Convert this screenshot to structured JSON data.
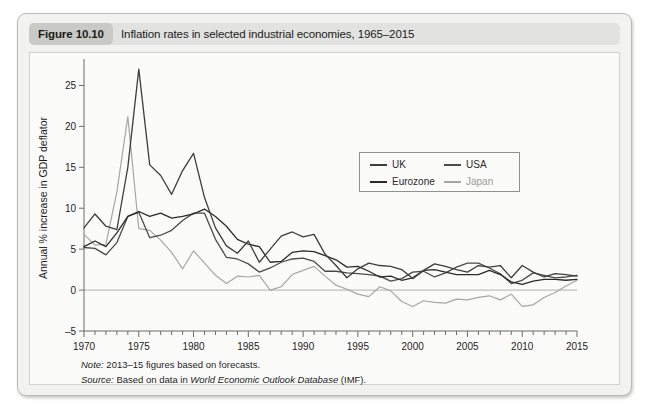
{
  "figure": {
    "badge": "Figure 10.10",
    "caption": "Inflation rates in selected industrial economies, 1965–2015"
  },
  "footnotes": {
    "note_label": "Note:",
    "note_text": " 2013–15 figures based on forecasts.",
    "source_label": "Source:",
    "source_prefix": " Based on data in ",
    "source_italic": "World Economic Outlook Database",
    "source_suffix": " (IMF)."
  },
  "legend": {
    "position": "inside-top-center",
    "entries": [
      {
        "name": "UK",
        "color": "#3d3d3d",
        "row": 0,
        "col": 0
      },
      {
        "name": "USA",
        "color": "#4a4a4a",
        "row": 0,
        "col": 1
      },
      {
        "name": "Eurozone",
        "color": "#2b2b2b",
        "row": 1,
        "col": 0
      },
      {
        "name": "Japan",
        "color": "#a6a6a4",
        "row": 1,
        "col": 1
      }
    ]
  },
  "chart_data": {
    "type": "line",
    "title": "Inflation rates in selected industrial economies, 1965–2015",
    "xlabel": "",
    "ylabel": "Annual % increase in GDP deflator",
    "xlim": [
      1970,
      2015
    ],
    "ylim": [
      -5,
      27.5
    ],
    "yticks": [
      -5,
      0,
      5,
      10,
      15,
      20,
      25
    ],
    "xticks": [
      1970,
      1975,
      1980,
      1985,
      1990,
      1995,
      2000,
      2005,
      2010,
      2015
    ],
    "xminor_step": 1,
    "grid": false,
    "zero_reference_line": true,
    "x": [
      1970,
      1971,
      1972,
      1973,
      1974,
      1975,
      1976,
      1977,
      1978,
      1979,
      1980,
      1981,
      1982,
      1983,
      1984,
      1985,
      1986,
      1987,
      1988,
      1989,
      1990,
      1991,
      1992,
      1993,
      1994,
      1995,
      1996,
      1997,
      1998,
      1999,
      2000,
      2001,
      2002,
      2003,
      2004,
      2005,
      2006,
      2007,
      2008,
      2009,
      2010,
      2011,
      2012,
      2013,
      2014,
      2015
    ],
    "series": [
      {
        "name": "UK",
        "color": "#3d3d3d",
        "values": [
          7.6,
          9.3,
          7.8,
          7.4,
          15.0,
          27.0,
          15.3,
          14.0,
          11.7,
          14.6,
          16.7,
          11.3,
          7.6,
          5.4,
          4.5,
          6.0,
          3.4,
          5.0,
          6.6,
          7.1,
          6.5,
          6.8,
          4.4,
          3.0,
          1.5,
          2.6,
          3.3,
          3.0,
          2.9,
          2.5,
          1.4,
          2.4,
          3.2,
          2.9,
          2.5,
          2.2,
          3.0,
          2.8,
          3.0,
          1.5,
          3.0,
          2.2,
          1.6,
          2.0,
          1.9,
          1.7
        ]
      },
      {
        "name": "USA",
        "color": "#4a4a4a",
        "values": [
          5.2,
          5.1,
          4.3,
          5.8,
          9.0,
          9.5,
          6.4,
          6.7,
          7.3,
          8.5,
          9.4,
          9.4,
          6.2,
          4.0,
          3.8,
          3.2,
          2.2,
          2.7,
          3.4,
          3.8,
          3.9,
          3.5,
          2.3,
          2.3,
          2.1,
          2.0,
          1.9,
          1.7,
          1.1,
          1.4,
          2.2,
          2.3,
          1.6,
          2.1,
          2.8,
          3.3,
          3.3,
          2.7,
          2.0,
          0.8,
          1.2,
          2.1,
          1.8,
          1.5,
          1.6,
          1.8
        ]
      },
      {
        "name": "Eurozone",
        "color": "#2b2b2b",
        "values": [
          5.3,
          6.0,
          5.3,
          7.0,
          9.0,
          9.6,
          9.0,
          9.4,
          8.8,
          9.0,
          9.3,
          9.9,
          9.0,
          7.8,
          6.2,
          5.6,
          5.3,
          3.4,
          3.5,
          4.6,
          4.8,
          4.7,
          4.2,
          3.7,
          2.8,
          2.9,
          2.3,
          1.6,
          1.7,
          1.2,
          1.5,
          2.4,
          2.5,
          2.2,
          1.9,
          1.9,
          1.9,
          2.4,
          1.9,
          1.0,
          0.7,
          1.1,
          1.3,
          1.3,
          1.2,
          1.3
        ]
      },
      {
        "name": "Japan",
        "color": "#a6a6a4",
        "values": [
          6.8,
          5.5,
          5.6,
          12.0,
          21.2,
          7.5,
          7.3,
          6.1,
          4.6,
          2.6,
          4.8,
          3.3,
          1.8,
          0.8,
          1.7,
          1.6,
          1.8,
          0.0,
          0.4,
          1.9,
          2.4,
          2.9,
          1.7,
          0.6,
          0.1,
          -0.5,
          -0.8,
          0.4,
          -0.1,
          -1.4,
          -2.0,
          -1.3,
          -1.5,
          -1.6,
          -1.1,
          -1.2,
          -0.9,
          -0.7,
          -1.2,
          -0.5,
          -2.0,
          -1.8,
          -0.9,
          -0.3,
          0.5,
          1.2
        ]
      }
    ]
  }
}
